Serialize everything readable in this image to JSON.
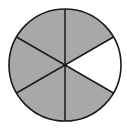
{
  "diagram": {
    "type": "fraction-circle",
    "total_parts": 6,
    "shaded_parts": 5,
    "unshaded_parts": 1,
    "fraction_shaded": "5/6",
    "shaded_color": "#a8a8a8",
    "unshaded_color": "#ffffff",
    "stroke_color": "#1a1a1a",
    "center": [
      65,
      65
    ],
    "radius": 56,
    "sectors": [
      {
        "index": 0,
        "start_deg": -30,
        "end_deg": 30,
        "shaded": false,
        "position": "right"
      },
      {
        "index": 1,
        "start_deg": 30,
        "end_deg": 90,
        "shaded": true,
        "position": "lower-right"
      },
      {
        "index": 2,
        "start_deg": 90,
        "end_deg": 150,
        "shaded": true,
        "position": "lower-left"
      },
      {
        "index": 3,
        "start_deg": 150,
        "end_deg": 210,
        "shaded": true,
        "position": "left"
      },
      {
        "index": 4,
        "start_deg": 210,
        "end_deg": 270,
        "shaded": true,
        "position": "upper-left"
      },
      {
        "index": 5,
        "start_deg": 270,
        "end_deg": 330,
        "shaded": true,
        "position": "upper-right"
      }
    ]
  }
}
